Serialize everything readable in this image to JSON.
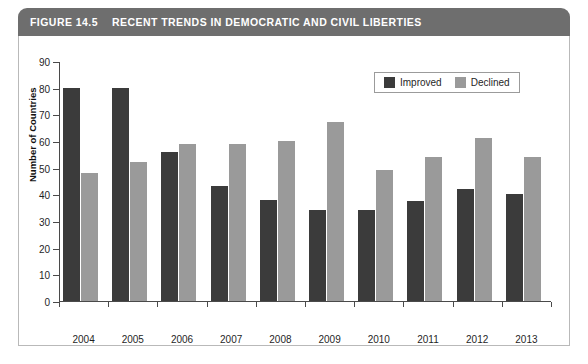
{
  "figure": {
    "number_label": "FIGURE 14.5",
    "title": "RECENT TRENDS IN DEMOCRATIC AND CIVIL LIBERTIES",
    "header_bg": "#6e6e6e",
    "header_text_color": "#ffffff"
  },
  "legend": {
    "position": "top-right",
    "entries": [
      {
        "label": "Improved",
        "color": "#3b3b3b"
      },
      {
        "label": "Declined",
        "color": "#9a9a9a"
      }
    ]
  },
  "axes": {
    "y_title": "Number of Countries",
    "y_ticks": [
      "0",
      "10",
      "20",
      "30",
      "40",
      "50",
      "60",
      "70",
      "80",
      "90"
    ],
    "x_ticks": [
      "2004",
      "2005",
      "2006",
      "2007",
      "2008",
      "2009",
      "2010",
      "2011",
      "2012",
      "2013"
    ]
  },
  "chart_data": {
    "type": "bar",
    "title": "RECENT TRENDS IN DEMOCRATIC AND CIVIL LIBERTIES",
    "xlabel": "",
    "ylabel": "Number of Countries",
    "ylim": [
      0,
      90
    ],
    "ytick_step": 10,
    "grid": false,
    "legend_position": "top-right",
    "categories": [
      "2004",
      "2005",
      "2006",
      "2007",
      "2008",
      "2009",
      "2010",
      "2011",
      "2012",
      "2013"
    ],
    "series": [
      {
        "name": "Improved",
        "color": "#3b3b3b",
        "values": [
          80,
          80,
          56,
          43,
          38,
          34,
          34,
          37.5,
          42,
          40
        ]
      },
      {
        "name": "Declined",
        "color": "#9a9a9a",
        "values": [
          48,
          52,
          59,
          59,
          60,
          67,
          49,
          54,
          61,
          54
        ]
      }
    ]
  }
}
